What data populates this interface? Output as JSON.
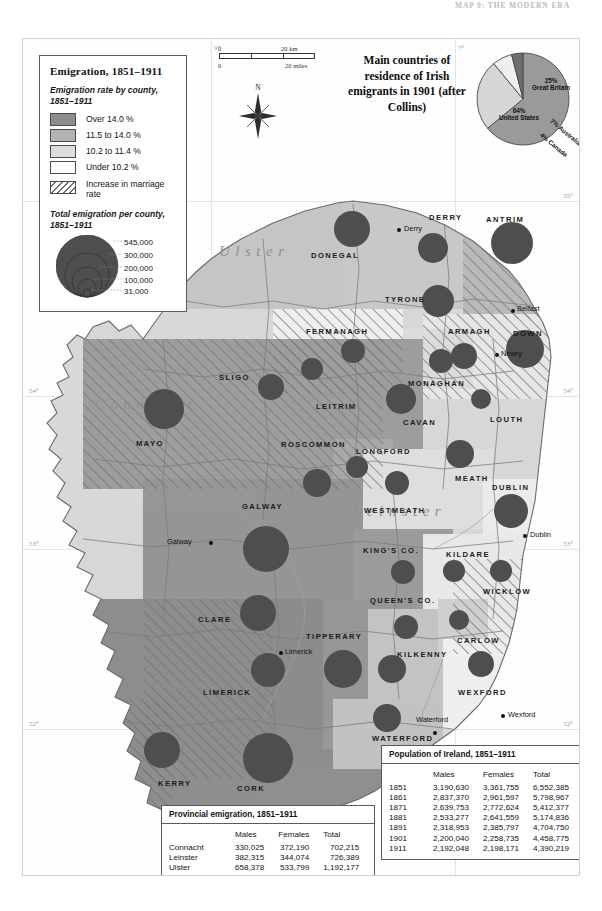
{
  "running_head": "MAP 9: THE MODERN ERA",
  "legend": {
    "title": "Emigration, 1851–1911",
    "rate_subtitle": "Emigration rate by county, 1851–1911",
    "rate_classes": [
      {
        "label": "Over 14.0 %",
        "color": "#8d8d8d"
      },
      {
        "label": "11.5 to 14.0 %",
        "color": "#b3b3b3"
      },
      {
        "label": "10.2 to 11.4 %",
        "color": "#dcdcdc"
      },
      {
        "label": "Under 10.2 %",
        "color": "#ffffff"
      }
    ],
    "hatch_label": "Increase in marriage rate",
    "prop_subtitle": "Total emigration per county, 1851–1911",
    "prop_values": [
      "545,000",
      "300,000",
      "200,000",
      "100,000",
      "31,000"
    ]
  },
  "scale": {
    "km_zero": "0",
    "km_max": "20 km",
    "mi_zero": "0",
    "mi_max": "20 miles",
    "north_label": "N"
  },
  "pie": {
    "title": "Main countries of residence of Irish emigrants in 1901 (after Collins)",
    "slices": [
      {
        "pct": "64%",
        "name": "United States",
        "value": 64,
        "color": "#9a9a9a"
      },
      {
        "pct": "25%",
        "name": "Great Britain",
        "value": 25,
        "color": "#d6d6d6"
      },
      {
        "pct": "7%",
        "name": "Australia",
        "value": 7,
        "color": "#efefef"
      },
      {
        "pct": "4%",
        "name": "Canada",
        "value": 4,
        "color": "#6e6e6e"
      }
    ]
  },
  "graticule": {
    "left_labels": [
      "54°",
      "53°",
      "52°"
    ],
    "right_labels": [
      "55°",
      "54°",
      "53°",
      "52°"
    ],
    "top_labels": [
      "9°",
      "7°"
    ]
  },
  "provinces": [
    {
      "name": "Ulster",
      "x": 196,
      "y": 204
    },
    {
      "name": "Connacht",
      "x": 72,
      "y": 357
    },
    {
      "name": "Leinster",
      "x": 330,
      "y": 464
    },
    {
      "name": "Munster",
      "x": 116,
      "y": 638
    }
  ],
  "counties": [
    {
      "name": "DONEGAL",
      "x": 288,
      "y": 212,
      "cx": 329,
      "cy": 190,
      "r": 18,
      "rate": 2,
      "hatch": false
    },
    {
      "name": "DERRY",
      "x": 406,
      "y": 174,
      "cx": 410,
      "cy": 209,
      "r": 15,
      "rate": 2,
      "hatch": false
    },
    {
      "name": "ANTRIM",
      "x": 463,
      "y": 176,
      "cx": 489,
      "cy": 204,
      "r": 21,
      "rate": 1,
      "hatch": true
    },
    {
      "name": "TYRONE",
      "x": 362,
      "y": 256,
      "cx": 415,
      "cy": 262,
      "r": 16,
      "rate": 2,
      "hatch": false
    },
    {
      "name": "FERMANAGH",
      "x": 283,
      "y": 288,
      "cx": 330,
      "cy": 312,
      "r": 12,
      "rate": 3,
      "hatch": true
    },
    {
      "name": "ARMAGH",
      "x": 425,
      "y": 288,
      "cx": 441,
      "cy": 317,
      "r": 13,
      "rate": 3,
      "hatch": true
    },
    {
      "name": "DOWN",
      "x": 490,
      "y": 290,
      "cx": 502,
      "cy": 310,
      "r": 19,
      "rate": 3,
      "hatch": true
    },
    {
      "name": "MONAGHAN",
      "x": 385,
      "y": 340,
      "cx": 418,
      "cy": 322,
      "r": 12,
      "rate": 3,
      "hatch": false
    },
    {
      "name": "CAVAN",
      "x": 380,
      "y": 379,
      "cx": 378,
      "cy": 360,
      "r": 15,
      "rate": 1,
      "hatch": true
    },
    {
      "name": "LOUTH",
      "x": 467,
      "y": 376,
      "cx": 458,
      "cy": 360,
      "r": 10,
      "rate": 3,
      "hatch": false
    },
    {
      "name": "SLIGO",
      "x": 196,
      "y": 334,
      "cx": 248,
      "cy": 348,
      "r": 13,
      "rate": 1,
      "hatch": true
    },
    {
      "name": "LEITRIM",
      "x": 293,
      "y": 363,
      "cx": 289,
      "cy": 330,
      "r": 11,
      "rate": 1,
      "hatch": true
    },
    {
      "name": "MAYO",
      "x": 113,
      "y": 400,
      "cx": 141,
      "cy": 370,
      "r": 20,
      "rate": 1,
      "hatch": true
    },
    {
      "name": "ROSCOMMON",
      "x": 258,
      "y": 401,
      "cx": 294,
      "cy": 444,
      "r": 14,
      "rate": 1,
      "hatch": true
    },
    {
      "name": "LONGFORD",
      "x": 333,
      "y": 408,
      "cx": 334,
      "cy": 428,
      "r": 11,
      "rate": 1,
      "hatch": true
    },
    {
      "name": "GALWAY",
      "x": 219,
      "y": 463,
      "cx": 243,
      "cy": 510,
      "r": 23,
      "rate": 1,
      "hatch": false
    },
    {
      "name": "WESTMEATH",
      "x": 341,
      "y": 467,
      "cx": 374,
      "cy": 444,
      "r": 12,
      "rate": 2,
      "hatch": false
    },
    {
      "name": "MEATH",
      "x": 432,
      "y": 435,
      "cx": 437,
      "cy": 415,
      "r": 14,
      "rate": 2,
      "hatch": false
    },
    {
      "name": "DUBLIN",
      "x": 469,
      "y": 444,
      "cx": 488,
      "cy": 472,
      "r": 17,
      "rate": 3,
      "hatch": false
    },
    {
      "name": "KING'S CO.",
      "x": 340,
      "y": 507,
      "cx": 380,
      "cy": 533,
      "r": 12,
      "rate": 1,
      "hatch": true
    },
    {
      "name": "KILDARE",
      "x": 423,
      "y": 511,
      "cx": 431,
      "cy": 532,
      "r": 11,
      "rate": 3,
      "hatch": false
    },
    {
      "name": "WICKLOW",
      "x": 460,
      "y": 548,
      "cx": 478,
      "cy": 532,
      "r": 11,
      "rate": 3,
      "hatch": true
    },
    {
      "name": "QUEEN'S CO.",
      "x": 347,
      "y": 557,
      "cx": 383,
      "cy": 588,
      "r": 12,
      "rate": 1,
      "hatch": false
    },
    {
      "name": "CLARE",
      "x": 175,
      "y": 576,
      "cx": 235,
      "cy": 574,
      "r": 18,
      "rate": 1,
      "hatch": true
    },
    {
      "name": "TIPPERARY",
      "x": 283,
      "y": 593,
      "cx": 320,
      "cy": 630,
      "r": 19,
      "rate": 1,
      "hatch": false
    },
    {
      "name": "KILKENNY",
      "x": 374,
      "y": 611,
      "cx": 369,
      "cy": 630,
      "r": 14,
      "rate": 2,
      "hatch": false
    },
    {
      "name": "CARLOW",
      "x": 434,
      "y": 597,
      "cx": 436,
      "cy": 581,
      "r": 10,
      "rate": 2,
      "hatch": false
    },
    {
      "name": "LIMERICK",
      "x": 180,
      "y": 649,
      "cx": 245,
      "cy": 631,
      "r": 17,
      "rate": 1,
      "hatch": false
    },
    {
      "name": "WEXFORD",
      "x": 435,
      "y": 649,
      "cx": 458,
      "cy": 625,
      "r": 13,
      "rate": 3,
      "hatch": false
    },
    {
      "name": "WATERFORD",
      "x": 349,
      "y": 695,
      "cx": 364,
      "cy": 679,
      "r": 14,
      "rate": 2,
      "hatch": false
    },
    {
      "name": "KERRY",
      "x": 135,
      "y": 740,
      "cx": 139,
      "cy": 711,
      "r": 18,
      "rate": 1,
      "hatch": true
    },
    {
      "name": "CORK",
      "x": 214,
      "y": 745,
      "cx": 245,
      "cy": 719,
      "r": 25,
      "rate": 1,
      "hatch": false
    }
  ],
  "cities": [
    {
      "name": "Derry",
      "x": 381,
      "y": 185,
      "dx": 374,
      "dy": 189
    },
    {
      "name": "Belfast",
      "x": 494,
      "y": 265,
      "dx": 488,
      "dy": 270
    },
    {
      "name": "Newry",
      "x": 478,
      "y": 310,
      "dx": 472,
      "dy": 314
    },
    {
      "name": "Dublin",
      "x": 507,
      "y": 491,
      "dx": 500,
      "dy": 495
    },
    {
      "name": "Galway",
      "x": 144,
      "y": 498,
      "dx": 186,
      "dy": 502
    },
    {
      "name": "Limerick",
      "x": 262,
      "y": 608,
      "dx": 256,
      "dy": 612
    },
    {
      "name": "Waterford",
      "x": 393,
      "y": 676,
      "dx": 410,
      "dy": 692
    },
    {
      "name": "Wexford",
      "x": 485,
      "y": 671,
      "dx": 478,
      "dy": 675
    }
  ],
  "table_provincial": {
    "title": "Provincial emigration, 1851–1911",
    "columns": [
      "",
      "Males",
      "Females",
      "Total"
    ],
    "rows": [
      [
        "Connacht",
        "330,025",
        "372,190",
        "702,215"
      ],
      [
        "Leinster",
        "382,315",
        "344,074",
        "726,389"
      ],
      [
        "Ulster",
        "658,378",
        "533,799",
        "1,192,177"
      ],
      [
        "Munster",
        "745,812",
        "714,220",
        "1,460,032"
      ]
    ]
  },
  "table_population": {
    "title": "Population of Ireland, 1851–1911",
    "columns": [
      "",
      "Males",
      "Females",
      "Total"
    ],
    "rows": [
      [
        "1851",
        "3,190,630",
        "3,361,755",
        "6,552,385"
      ],
      [
        "1861",
        "2,837,370",
        "2,961,597",
        "5,798,967"
      ],
      [
        "1871",
        "2,639,753",
        "2,772,624",
        "5,412,377"
      ],
      [
        "1881",
        "2,533,277",
        "2,641,559",
        "5,174,836"
      ],
      [
        "1891",
        "2,318,953",
        "2,385,797",
        "4,704,750"
      ],
      [
        "1901",
        "2,200,040",
        "2,258,735",
        "4,458,775"
      ],
      [
        "1911",
        "2,192,048",
        "2,198,171",
        "4,390,219"
      ]
    ]
  }
}
